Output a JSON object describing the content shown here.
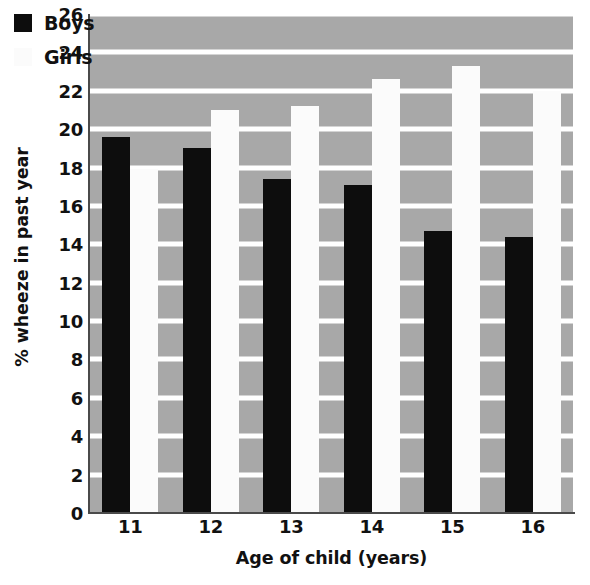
{
  "chart_data": {
    "type": "bar",
    "title": "",
    "subtitle": "",
    "xlabel": "Age of child (years)",
    "ylabel": "% wheeze in past year",
    "categories": [
      "11",
      "12",
      "13",
      "14",
      "15",
      "16"
    ],
    "series": [
      {
        "name": "Boys",
        "color": "#0d0d0d",
        "values": [
          19.6,
          19.0,
          17.4,
          17.1,
          14.7,
          14.4
        ]
      },
      {
        "name": "Girls",
        "color": "#fbfbfb",
        "values": [
          17.9,
          21.0,
          21.2,
          22.6,
          23.3,
          22.0
        ]
      }
    ],
    "ylim": [
      0,
      26
    ],
    "ytick_step": 2,
    "yticks": [
      "0",
      "2",
      "4",
      "6",
      "8",
      "10",
      "12",
      "14",
      "16",
      "18",
      "20",
      "22",
      "24",
      "26"
    ],
    "grid": "horizontal",
    "grid_color": "#ffffff",
    "plot_background": "#a8a8a8",
    "legend_position": "top-left",
    "legend_entries": [
      "Boys",
      "Girls"
    ]
  }
}
